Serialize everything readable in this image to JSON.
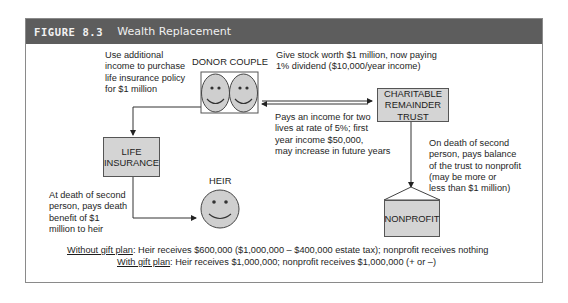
{
  "figure": {
    "number": "FIGURE 8.3",
    "title": "Wealth Replacement"
  },
  "nodes": {
    "donor_couple": {
      "label": "DONOR COUPLE",
      "icon": "two-smiley-faces"
    },
    "charitable_trust": {
      "label": "CHARITABLE\nREMAINDER\nTRUST"
    },
    "life_insurance": {
      "label": "LIFE\nINSURANCE"
    },
    "heir": {
      "label": "HEIR",
      "icon": "smiley-face"
    },
    "nonprofit": {
      "label": "NONPROFIT"
    }
  },
  "annotations": {
    "use_income": "Use additional\nincome to purchase\nlife insurance policy\nfor $1 million",
    "give_stock": "Give stock worth $1 million, now paying\n1% dividend ($10,000/year income)",
    "pays_income": "Pays an income for two\nlives at rate of 5%; first\nyear income $50,000,\nmay increase in future years",
    "on_death_trust": "On death of second\nperson, pays balance\nof the trust to nonprofit\n(may be more or\nless than $1 million)",
    "on_death_insurance": "At death of second\nperson, pays death\nbenefit of $1\nmillion to heir"
  },
  "summary": {
    "without": {
      "label": "Without gift plan",
      "text": ": Heir receives $600,000 ($1,000,000 – $400,000 estate tax); nonprofit receives nothing"
    },
    "with": {
      "label": "With gift plan",
      "text": ": Heir receives $1,000,000; nonprofit receives $1,000,000 (+ or –)"
    }
  },
  "colors": {
    "header_bg": "#5d5d5d",
    "box_fill": "#d4d4d4",
    "face_fill": "#cfcfcf"
  }
}
